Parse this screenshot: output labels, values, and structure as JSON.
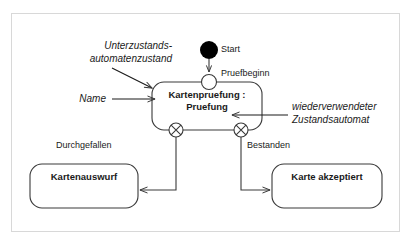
{
  "diagram": {
    "type": "uml-state-machine-diagram",
    "language": "de",
    "frame": {
      "border_color": "#d8d8d8",
      "background": "#ffffff"
    },
    "line_color": "#3a3a3a",
    "text_color": "#1a1a1a",
    "initial_state": {
      "name": "start-node",
      "label": "Start",
      "shape": "filled-circle",
      "fill": "#000000"
    },
    "entry_point": {
      "name": "entry-point",
      "label": "Pruefbeginn",
      "shape": "hollow-circle"
    },
    "composite_state": {
      "name": "kartenpruefung-state",
      "label_line1": "Kartenpruefung :",
      "label_line2": "Pruefung",
      "shape": "rounded-rectangle"
    },
    "exit_points": [
      {
        "name": "exit-point-durchgefallen",
        "label": "Durchgefallen",
        "shape": "circle-with-x"
      },
      {
        "name": "exit-point-bestanden",
        "label": "Bestanden",
        "shape": "circle-with-x"
      }
    ],
    "target_states": [
      {
        "name": "kartenauswurf-state",
        "label": "Kartenauswurf",
        "shape": "rounded-rectangle"
      },
      {
        "name": "karte-akzeptiert-state",
        "label": "Karte akzeptiert",
        "shape": "rounded-rectangle"
      }
    ],
    "annotations": [
      {
        "name": "annotation-unterzustandsautomatenzustand",
        "line1": "Unterzustands-",
        "line2": "automatenzustand",
        "style": "italic"
      },
      {
        "name": "annotation-name",
        "line1": "Name",
        "style": "italic"
      },
      {
        "name": "annotation-wiederverwendeter-zustandsautomat",
        "line1": "wiederverwendeter",
        "line2": "Zustandsautomat",
        "style": "italic"
      }
    ]
  }
}
